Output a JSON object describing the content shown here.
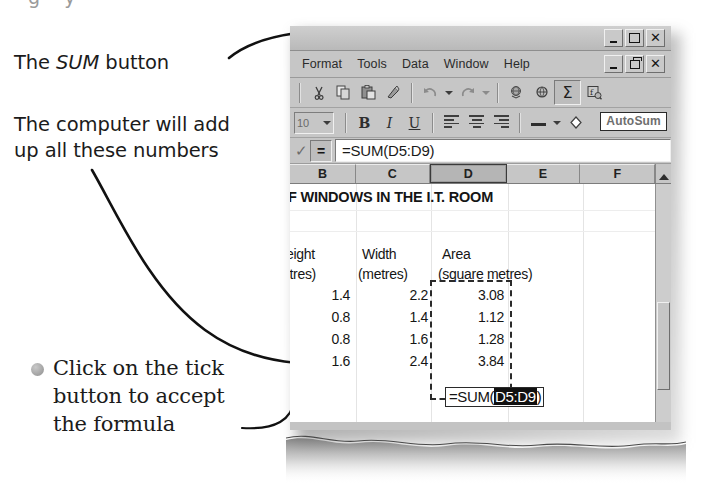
{
  "annotations": {
    "top_sliver": "g    y",
    "sum_button": {
      "prefix": "The ",
      "emphasis": "SUM",
      "suffix": " button"
    },
    "computer_add": "The computer will add\nup all these numbers",
    "click_tick": "Click on the tick\nbutton to accept\nthe formula"
  },
  "window": {
    "menus": [
      "Format",
      "Tools",
      "Data",
      "Window",
      "Help"
    ],
    "app_controls": [
      "minimize",
      "maximize",
      "close"
    ],
    "doc_controls": [
      "minimize",
      "restore",
      "close"
    ],
    "standard_toolbar": [
      {
        "name": "cut-icon",
        "glyph": "✂"
      },
      {
        "name": "copy-icon",
        "glyph": "⧉"
      },
      {
        "name": "paste-icon",
        "glyph": "▤"
      },
      {
        "name": "format-painter-icon",
        "glyph": "✎"
      },
      {
        "name": "undo-icon",
        "glyph": "↶"
      },
      {
        "name": "redo-icon",
        "glyph": "↷"
      },
      {
        "name": "hyperlink-icon",
        "glyph": "⊕"
      },
      {
        "name": "web-toolbar-icon",
        "glyph": "⌘"
      },
      {
        "name": "autosum-icon",
        "glyph": "Σ"
      },
      {
        "name": "paste-function-icon",
        "glyph": "ƒ"
      }
    ],
    "formatting_toolbar": {
      "font_size": "10",
      "bold": "B",
      "italic": "I",
      "underline": "U",
      "align": [
        "align-left",
        "align-center",
        "align-right"
      ],
      "borders": "borders-icon",
      "fill_color": "fill-color-icon"
    },
    "tooltip": "AutoSum",
    "formula_bar": {
      "cancel": "tick-icon",
      "equals": "=",
      "value": "=SUM(D5:D9)"
    },
    "column_headers": [
      "B",
      "C",
      "D",
      "E",
      "F"
    ],
    "selected_column": "D"
  },
  "sheet": {
    "title": "WINDOWS IN THE I.T. ROOM",
    "title_clipped_prefix": "F",
    "headers": {
      "b1": "eight",
      "b2": "etres)",
      "c1": "Width",
      "c2": "(metres)",
      "d1": "Area",
      "d2": "(square metres)"
    },
    "rows": [
      {
        "height": "1.4",
        "width": "2.2",
        "area": "3.08"
      },
      {
        "height": "0.8",
        "width": "1.4",
        "area": "1.12"
      },
      {
        "height": "0.8",
        "width": "1.6",
        "area": "1.28"
      },
      {
        "height": "1.6",
        "width": "2.4",
        "area": "3.84"
      }
    ],
    "cell_edit": {
      "prefix": "=SUM(",
      "range": "D5:D9",
      "suffix": ")"
    }
  },
  "colors": {
    "chrome": "#c6c6c6",
    "ink": "#1b1b1b",
    "selection": "#111111"
  }
}
